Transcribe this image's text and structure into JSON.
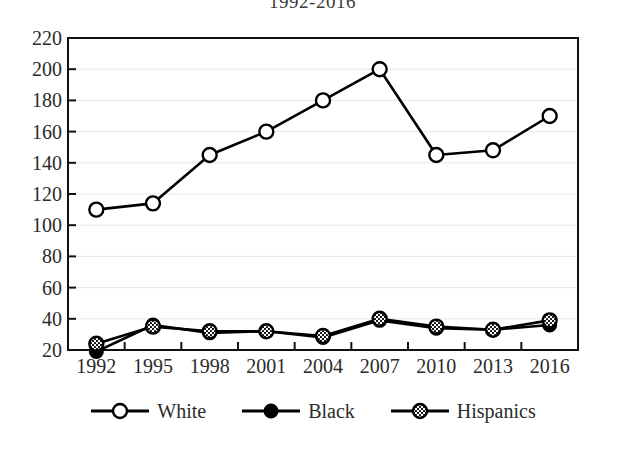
{
  "chart_data": {
    "type": "line",
    "title": "1992-2016",
    "xlabel": "",
    "ylabel": "",
    "categories": [
      "1992",
      "1995",
      "1998",
      "2001",
      "2004",
      "2007",
      "2010",
      "2013",
      "2016"
    ],
    "x": [
      1992,
      1995,
      1998,
      2001,
      2004,
      2007,
      2010,
      2013,
      2016
    ],
    "ylim": [
      20,
      220
    ],
    "ytick_step": 20,
    "yticks": [
      20,
      40,
      60,
      80,
      100,
      120,
      140,
      160,
      180,
      200,
      220
    ],
    "ytick_labels": [
      "20",
      "40",
      "60",
      "80",
      "100",
      "120",
      "140",
      "160",
      "180",
      "200",
      "220"
    ],
    "grid": true,
    "grid_axis": "y",
    "legend_position": "bottom",
    "series": [
      {
        "name": "White",
        "marker": "open-circle",
        "color": "#000000",
        "values": [
          110,
          114,
          145,
          160,
          180,
          200,
          145,
          148,
          170
        ]
      },
      {
        "name": "Black",
        "marker": "filled-circle",
        "color": "#000000",
        "values": [
          19,
          36,
          31,
          32,
          28,
          39,
          34,
          33,
          36
        ]
      },
      {
        "name": "Hispanics",
        "marker": "hatched-circle",
        "color": "#000000",
        "values": [
          24,
          35,
          32,
          32,
          29,
          40,
          35,
          33,
          39
        ]
      }
    ]
  },
  "legend": {
    "items": [
      {
        "label": "White",
        "marker": "open-circle"
      },
      {
        "label": "Black",
        "marker": "filled-circle"
      },
      {
        "label": "Hispanics",
        "marker": "hatched-circle"
      }
    ]
  },
  "colors": {
    "line": "#000000",
    "axis": "#111111",
    "grid": "#e8e8ea",
    "text": "#2b2b2b",
    "marker_fill_open": "#ffffff",
    "marker_fill_solid": "#000000"
  }
}
